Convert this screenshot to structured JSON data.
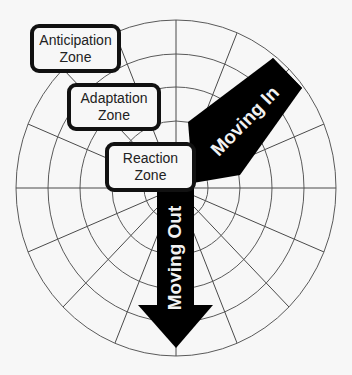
{
  "diagram": {
    "type": "radial zone diagram",
    "background": "#f7f7f7",
    "grid": {
      "center": [
        176,
        188
      ],
      "rings_radii": [
        32,
        64,
        96,
        128,
        160
      ],
      "spoke_count": 16,
      "spoke_angle_step_deg": 22.5,
      "line_color": "#555555"
    },
    "zones": [
      {
        "id": "anticipation",
        "line1": "Anticipation",
        "line2": "Zone"
      },
      {
        "id": "adaptation",
        "line1": "Adaptation",
        "line2": "Zone"
      },
      {
        "id": "reaction",
        "line1": "Reaction",
        "line2": "Zone"
      }
    ],
    "arrows": [
      {
        "id": "moving-in",
        "label": "Moving In",
        "direction": "toward center",
        "color": "#000000"
      },
      {
        "id": "moving-out",
        "label": "Moving Out",
        "direction": "away from center",
        "color": "#000000"
      }
    ]
  }
}
